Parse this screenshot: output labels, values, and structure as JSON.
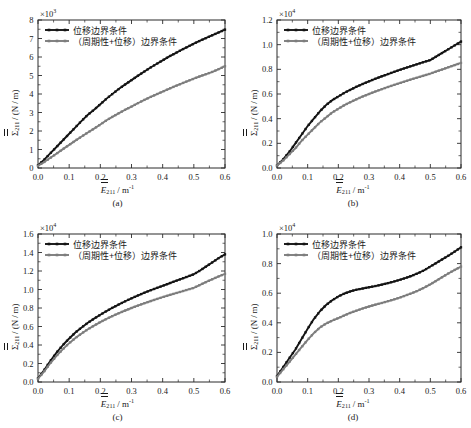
{
  "figure": {
    "background": "#ffffff",
    "series_colors": {
      "displacement": "#141414",
      "periodic_displacement": "#7d7d7d"
    },
    "legend": {
      "displacement_label": "位移边界条件",
      "periodic_displacement_label": "（周期性+位移）边界条件"
    },
    "axis_text": {
      "y_sigma": "Σ",
      "y_sub": "211",
      "y_unit": "/ (N / m)",
      "x_e": "E",
      "x_sub": "211",
      "x_unit": "/ m",
      "x_exp": "-1"
    }
  },
  "chart_data": [
    {
      "type": "line",
      "panel": "(a)",
      "title": "",
      "xlabel": "Ē₂₁₁/m⁻¹",
      "ylabel": "Σ̄₂₁₁/(N/m)",
      "y_exponent": "×10³",
      "y_exponent_mantissa": "×10",
      "y_exponent_power": "3",
      "xlim": [
        0.0,
        0.6
      ],
      "ylim": [
        0,
        8
      ],
      "xticks": [
        "0.0",
        "0.1",
        "0.2",
        "0.3",
        "0.4",
        "0.5",
        "0.6"
      ],
      "yticks": [
        "0",
        "1",
        "2",
        "3",
        "4",
        "5",
        "6",
        "7",
        "8"
      ],
      "grid": false,
      "legend_position": "upper-left",
      "x": [
        0.0,
        0.02,
        0.04,
        0.06,
        0.08,
        0.1,
        0.12,
        0.14,
        0.16,
        0.18,
        0.2,
        0.22,
        0.24,
        0.26,
        0.28,
        0.3,
        0.32,
        0.34,
        0.36,
        0.38,
        0.4,
        0.42,
        0.44,
        0.46,
        0.48,
        0.5,
        0.52,
        0.54,
        0.56,
        0.58,
        0.6
      ],
      "series": [
        {
          "name": "位移边界条件",
          "color": "#141414",
          "values": [
            0.15,
            0.45,
            0.8,
            1.15,
            1.5,
            1.85,
            2.2,
            2.55,
            2.88,
            3.15,
            3.45,
            3.75,
            4.02,
            4.28,
            4.52,
            4.75,
            4.98,
            5.2,
            5.42,
            5.62,
            5.82,
            6.02,
            6.2,
            6.38,
            6.55,
            6.72,
            6.88,
            7.03,
            7.18,
            7.33,
            7.48
          ]
        },
        {
          "name": "（周期性+位移）边界条件",
          "color": "#7d7d7d",
          "values": [
            0.12,
            0.32,
            0.55,
            0.78,
            1.02,
            1.25,
            1.48,
            1.7,
            1.92,
            2.13,
            2.35,
            2.58,
            2.78,
            2.97,
            3.15,
            3.32,
            3.5,
            3.67,
            3.83,
            3.98,
            4.13,
            4.28,
            4.42,
            4.56,
            4.7,
            4.83,
            4.96,
            5.08,
            5.2,
            5.35,
            5.5
          ]
        }
      ]
    },
    {
      "type": "line",
      "panel": "(b)",
      "title": "",
      "xlabel": "Ē₂₁₁/m⁻¹",
      "ylabel": "Σ̄₂₁₁/(N/m)",
      "y_exponent": "×10⁴",
      "y_exponent_mantissa": "×10",
      "y_exponent_power": "4",
      "xlim": [
        0.0,
        0.6
      ],
      "ylim": [
        0.0,
        1.2
      ],
      "xticks": [
        "0.0",
        "0.1",
        "0.2",
        "0.3",
        "0.4",
        "0.5",
        "0.6"
      ],
      "yticks": [
        "0.0",
        "0.2",
        "0.4",
        "0.6",
        "0.8",
        "1.0",
        "1.2"
      ],
      "grid": false,
      "legend_position": "upper-left",
      "x": [
        0.0,
        0.02,
        0.04,
        0.06,
        0.08,
        0.1,
        0.12,
        0.14,
        0.16,
        0.18,
        0.2,
        0.22,
        0.24,
        0.26,
        0.28,
        0.3,
        0.32,
        0.34,
        0.36,
        0.38,
        0.4,
        0.42,
        0.44,
        0.46,
        0.48,
        0.5,
        0.52,
        0.54,
        0.56,
        0.58,
        0.6
      ],
      "series": [
        {
          "name": "位移边界条件",
          "color": "#141414",
          "values": [
            0.02,
            0.07,
            0.13,
            0.2,
            0.27,
            0.34,
            0.4,
            0.46,
            0.51,
            0.55,
            0.58,
            0.61,
            0.635,
            0.66,
            0.682,
            0.703,
            0.723,
            0.742,
            0.76,
            0.778,
            0.795,
            0.812,
            0.828,
            0.844,
            0.86,
            0.875,
            0.905,
            0.935,
            0.965,
            0.995,
            1.025
          ]
        },
        {
          "name": "（周期性+位移）边界条件",
          "color": "#7d7d7d",
          "values": [
            0.02,
            0.06,
            0.11,
            0.16,
            0.22,
            0.27,
            0.32,
            0.37,
            0.41,
            0.45,
            0.48,
            0.51,
            0.535,
            0.558,
            0.58,
            0.6,
            0.62,
            0.638,
            0.655,
            0.672,
            0.688,
            0.704,
            0.72,
            0.735,
            0.75,
            0.765,
            0.783,
            0.8,
            0.818,
            0.835,
            0.852
          ]
        }
      ]
    },
    {
      "type": "line",
      "panel": "(c)",
      "title": "",
      "xlabel": "Ē₂₁₁/m⁻¹",
      "ylabel": "Σ̄₂₁₁/(N/m)",
      "y_exponent": "×10⁴",
      "y_exponent_mantissa": "×10",
      "y_exponent_power": "4",
      "xlim": [
        0.0,
        0.6
      ],
      "ylim": [
        0.0,
        1.6
      ],
      "xticks": [
        "0.0",
        "0.1",
        "0.2",
        "0.3",
        "0.4",
        "0.5",
        "0.6"
      ],
      "yticks": [
        "0.0",
        "0.2",
        "0.4",
        "0.6",
        "0.8",
        "1.0",
        "1.2",
        "1.4",
        "1.6"
      ],
      "grid": false,
      "legend_position": "upper-left",
      "x": [
        0.0,
        0.02,
        0.04,
        0.06,
        0.08,
        0.1,
        0.12,
        0.14,
        0.16,
        0.18,
        0.2,
        0.22,
        0.24,
        0.26,
        0.28,
        0.3,
        0.32,
        0.34,
        0.36,
        0.38,
        0.4,
        0.42,
        0.44,
        0.46,
        0.48,
        0.5,
        0.52,
        0.54,
        0.56,
        0.58,
        0.6
      ],
      "series": [
        {
          "name": "位移边界条件",
          "color": "#141414",
          "values": [
            0.04,
            0.13,
            0.23,
            0.32,
            0.4,
            0.47,
            0.535,
            0.59,
            0.64,
            0.685,
            0.727,
            0.767,
            0.805,
            0.84,
            0.873,
            0.905,
            0.935,
            0.963,
            0.99,
            1.015,
            1.04,
            1.065,
            1.09,
            1.115,
            1.14,
            1.165,
            1.205,
            1.25,
            1.295,
            1.34,
            1.38
          ]
        },
        {
          "name": "（周期性+位移）边界条件",
          "color": "#7d7d7d",
          "values": [
            0.035,
            0.115,
            0.205,
            0.285,
            0.355,
            0.42,
            0.475,
            0.525,
            0.57,
            0.61,
            0.648,
            0.683,
            0.715,
            0.745,
            0.773,
            0.8,
            0.825,
            0.85,
            0.873,
            0.895,
            0.917,
            0.938,
            0.958,
            0.978,
            0.998,
            1.018,
            1.05,
            1.082,
            1.112,
            1.142,
            1.17
          ]
        }
      ]
    },
    {
      "type": "line",
      "panel": "(d)",
      "title": "",
      "xlabel": "Ē₂₁₁/m⁻¹",
      "ylabel": "Σ̄₂₁₁/(N/m)",
      "y_exponent": "×10⁴",
      "y_exponent_mantissa": "×10",
      "y_exponent_power": "4",
      "xlim": [
        0.0,
        0.6
      ],
      "ylim": [
        0.0,
        1.0
      ],
      "xticks": [
        "0.0",
        "0.1",
        "0.2",
        "0.3",
        "0.4",
        "0.5",
        "0.6"
      ],
      "yticks": [
        "0.0",
        "0.2",
        "0.4",
        "0.6",
        "0.8",
        "1.0"
      ],
      "grid": false,
      "legend_position": "upper-left",
      "x": [
        0.0,
        0.02,
        0.04,
        0.06,
        0.08,
        0.1,
        0.12,
        0.14,
        0.16,
        0.18,
        0.2,
        0.22,
        0.24,
        0.26,
        0.28,
        0.3,
        0.32,
        0.34,
        0.36,
        0.38,
        0.4,
        0.42,
        0.44,
        0.46,
        0.48,
        0.5,
        0.52,
        0.54,
        0.56,
        0.58,
        0.6
      ],
      "series": [
        {
          "name": "位移边界条件",
          "color": "#141414",
          "values": [
            0.04,
            0.1,
            0.16,
            0.22,
            0.29,
            0.36,
            0.425,
            0.478,
            0.52,
            0.552,
            0.578,
            0.598,
            0.613,
            0.624,
            0.632,
            0.64,
            0.648,
            0.657,
            0.667,
            0.678,
            0.69,
            0.703,
            0.718,
            0.735,
            0.755,
            0.78,
            0.805,
            0.83,
            0.855,
            0.882,
            0.91
          ]
        },
        {
          "name": "（周期性+位移）边界条件",
          "color": "#7d7d7d",
          "values": [
            0.035,
            0.085,
            0.135,
            0.185,
            0.235,
            0.285,
            0.33,
            0.368,
            0.395,
            0.415,
            0.432,
            0.45,
            0.468,
            0.483,
            0.497,
            0.51,
            0.522,
            0.533,
            0.545,
            0.557,
            0.57,
            0.585,
            0.6,
            0.618,
            0.638,
            0.66,
            0.685,
            0.71,
            0.735,
            0.758,
            0.78
          ]
        }
      ]
    }
  ]
}
